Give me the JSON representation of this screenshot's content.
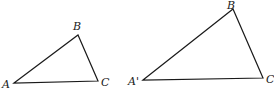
{
  "diagram": {
    "type": "similar-triangles",
    "stroke_color": "#1a1a1a",
    "triangles": [
      {
        "id": "triangle-abc",
        "vertices": [
          {
            "name": "A",
            "x": 14,
            "y": 83,
            "label": "A",
            "label_x": 2,
            "label_y": 88
          },
          {
            "name": "B",
            "x": 78,
            "y": 35,
            "label": "B",
            "label_x": 73,
            "label_y": 30
          },
          {
            "name": "C",
            "x": 98,
            "y": 81,
            "label": "C",
            "label_x": 101,
            "label_y": 86
          }
        ]
      },
      {
        "id": "triangle-a-prime",
        "vertices": [
          {
            "name": "A'",
            "x": 143,
            "y": 80,
            "label": "A'",
            "label_x": 128,
            "label_y": 85
          },
          {
            "name": "B",
            "x": 233,
            "y": 9,
            "label": "B",
            "label_x": 227,
            "label_y": 9
          },
          {
            "name": "C",
            "x": 263,
            "y": 78,
            "label": "C",
            "label_x": 266,
            "label_y": 83
          }
        ]
      }
    ]
  }
}
